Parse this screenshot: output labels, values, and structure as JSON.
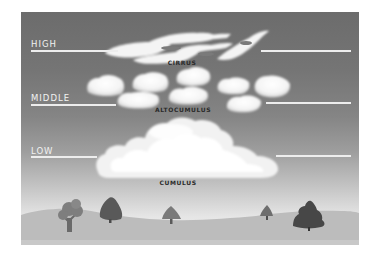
{
  "diagram": {
    "levels": [
      {
        "label": "HIGH",
        "cloud": "CIRRUS"
      },
      {
        "label": "MIDDLE",
        "cloud": "ALTOCUMULUS"
      },
      {
        "label": "LOW",
        "cloud": "CUMULUS"
      }
    ],
    "colors": {
      "sky_top": "#6c6c6c",
      "sky_horizon": "#ececec",
      "cloud": "#f7f7f7",
      "ground": "#bcbcbc",
      "tree_dark": "#4a4a4a",
      "tree_mid": "#6e6e6e",
      "tree_light": "#8a8a8a"
    }
  }
}
